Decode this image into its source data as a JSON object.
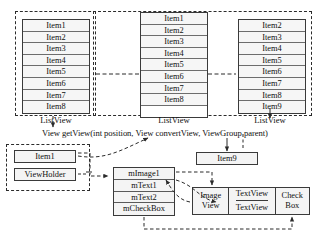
{
  "diagram": {
    "title_text": "View getView(int position, View convertView, ViewGroup parent)",
    "colors": {
      "stroke": "#3a3a3a",
      "dashed_stroke": "#2b2b2b",
      "cell_fill": "#f6f6f6",
      "box_fill": "#f4f4f4",
      "background": "#ffffff"
    }
  },
  "listviews": [
    {
      "id": "listview-left",
      "caption": "ListView",
      "items": [
        "Item1",
        "Item2",
        "Item3",
        "Item4",
        "Item5",
        "Item6",
        "Item7",
        "Item8"
      ],
      "empty_slots": 0
    },
    {
      "id": "listview-middle",
      "caption": "ListView",
      "items": [
        "Item1",
        "Item2",
        "Item3",
        "Item4",
        "Item5",
        "Item6",
        "Item7",
        "Item8"
      ],
      "empty_slots": 1
    },
    {
      "id": "listview-right",
      "caption": "ListView",
      "items": [
        "Item2",
        "Item3",
        "Item4",
        "Item5",
        "Item6",
        "Item7",
        "Item8",
        "Item9"
      ],
      "empty_slots": 0
    }
  ],
  "recycled": {
    "item_label": "Item1",
    "holder_label": "ViewHolder"
  },
  "new_item": {
    "label": "Item9"
  },
  "view_holder_fields": {
    "label": "ViewHolder fields",
    "fields": [
      "mImage1",
      "mText1",
      "mText2",
      "mCheckBox"
    ]
  },
  "widgets": {
    "image_view": [
      "Image",
      "View"
    ],
    "text_views": [
      "TextView",
      "TextView"
    ],
    "check_box": [
      "Check",
      "Box"
    ]
  }
}
